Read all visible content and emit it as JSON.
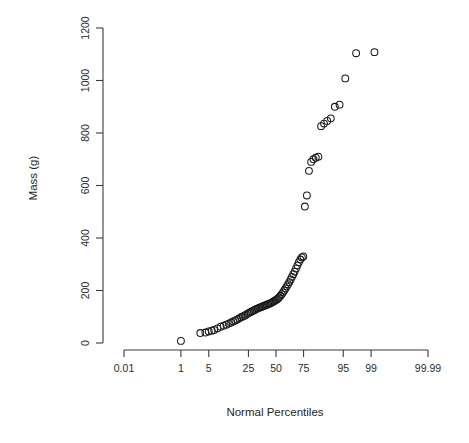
{
  "figure": {
    "background_color": "#ffffff",
    "foreground_color": "#1b1b1b",
    "width": 469,
    "height": 443
  },
  "axes": {
    "x_title": "Normal Percentiles",
    "y_title": "Mass (g)",
    "x_tick_labels": [
      "0.01",
      "1",
      "5",
      "25",
      "50",
      "75",
      "95",
      "99",
      "99.99"
    ],
    "y_tick_labels": [
      "0",
      "200",
      "400",
      "600",
      "800",
      "1000",
      "1200"
    ]
  },
  "chart_data": {
    "type": "scatter",
    "title": "",
    "subtitle": "",
    "xlabel": "Normal Percentiles",
    "ylabel": "Mass (g)",
    "x_scale": "normal-probability",
    "grid": false,
    "legend": null,
    "marker": "open-circle",
    "xlim": [
      0.01,
      99.99
    ],
    "ylim": [
      0,
      1200
    ],
    "x_ticks": [
      0.01,
      1,
      5,
      25,
      50,
      75,
      95,
      99,
      99.99
    ],
    "x_tick_labels": [
      "0.01",
      "1",
      "5",
      "25",
      "50",
      "75",
      "95",
      "99",
      "99.99"
    ],
    "y_ticks": [
      0,
      200,
      400,
      600,
      800,
      1000,
      1200
    ],
    "y_tick_labels": [
      "0",
      "200",
      "400",
      "600",
      "800",
      "1000",
      "1200"
    ],
    "n_points": 79,
    "x": [
      1.0,
      3.2,
      4.2,
      5.0,
      5.8,
      6.5,
      7.6,
      8.8,
      10.0,
      11.2,
      12.4,
      13.6,
      14.8,
      16.0,
      17.2,
      18.4,
      19.6,
      20.8,
      22.0,
      23.2,
      24.4,
      25.6,
      26.8,
      28.0,
      29.2,
      30.4,
      31.6,
      32.8,
      34.0,
      35.2,
      36.4,
      37.6,
      38.8,
      40.0,
      41.2,
      42.4,
      43.6,
      44.8,
      46.0,
      47.2,
      48.4,
      49.6,
      50.8,
      52.0,
      53.2,
      54.4,
      55.6,
      56.8,
      58.0,
      59.2,
      60.4,
      61.6,
      62.8,
      64.0,
      65.2,
      66.4,
      67.6,
      68.8,
      70.0,
      71.2,
      72.4,
      73.6,
      74.8,
      76.0,
      77.5,
      79.0,
      80.5,
      82.0,
      83.5,
      85.0,
      86.5,
      88.0,
      89.5,
      91.0,
      92.5,
      94.0,
      95.5,
      97.5,
      99.2
    ],
    "y": [
      8,
      38,
      40,
      44,
      47,
      50,
      56,
      62,
      66,
      70,
      74,
      78,
      82,
      86,
      90,
      94,
      98,
      101,
      104,
      108,
      112,
      115,
      118,
      121,
      124,
      127,
      130,
      132,
      134,
      136,
      138,
      140,
      142,
      144,
      146,
      148,
      150,
      152,
      154,
      157,
      160,
      163,
      166,
      170,
      175,
      180,
      186,
      193,
      200,
      208,
      216,
      224,
      232,
      242,
      252,
      262,
      272,
      284,
      296,
      308,
      318,
      326,
      330,
      520,
      562,
      656,
      690,
      700,
      706,
      710,
      826,
      836,
      846,
      856,
      900,
      908,
      1008,
      1104,
      1108
    ]
  }
}
